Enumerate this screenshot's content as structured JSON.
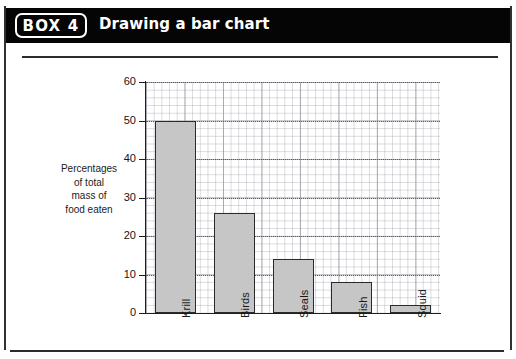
{
  "header": {
    "box_label": "BOX 4",
    "title": "Drawing a bar chart"
  },
  "chart_data": {
    "type": "bar",
    "title": "",
    "categories": [
      "Krill",
      "Birds",
      "Seals",
      "Fish",
      "Squid"
    ],
    "values": [
      50,
      26,
      14,
      8,
      2
    ],
    "xlabel": "",
    "ylabel": "Percentages of total mass of food eaten",
    "ylabel_lines": [
      "Percentages",
      "of total",
      "mass of",
      "food eaten"
    ],
    "ylim": [
      0,
      60
    ],
    "ytick_labels": [
      "0",
      "10",
      "20",
      "30",
      "40",
      "50",
      "60"
    ],
    "ytick_values": [
      0,
      10,
      20,
      30,
      40,
      50,
      60
    ],
    "grid": true,
    "grid_minor_step": 2,
    "legend": "none",
    "bar_fill_color": "#c6c6c6",
    "bar_edge_color": "#2b2b2b",
    "axis_color": "#1f1f1f"
  }
}
